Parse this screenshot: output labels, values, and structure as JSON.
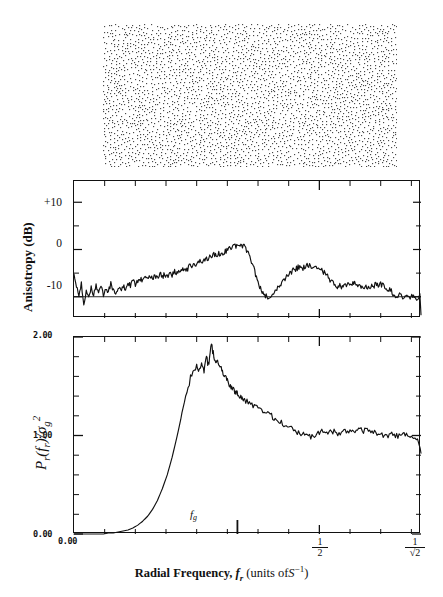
{
  "figure": {
    "panels": {
      "dot_pattern": {
        "name": "stochastic dot pattern"
      },
      "anisotropy": {
        "ylabel_text": "Anisotropy  (dB)",
        "yticks": [
          {
            "value": 10,
            "label": "+10"
          },
          {
            "value": 0,
            "label": "0"
          },
          {
            "value": -10,
            "label": "-10"
          }
        ],
        "reference_line": -10
      },
      "power": {
        "ylabel_parts": {
          "p": "P",
          "rsub": "r",
          "open": "(",
          "f": "f",
          "fsub": "r",
          "close": ")",
          "slash": "/",
          "sigma": "σ",
          "gsub": "g",
          "exp": "2"
        },
        "yticks": [
          {
            "value": 2.0,
            "label": "2.00"
          },
          {
            "value": 1.0,
            "label": "1.00"
          },
          {
            "value": 0.0,
            "label": "0.00"
          }
        ]
      }
    },
    "xaxis": {
      "caption_prefix": "Radial Frequency,",
      "caption_var": "f",
      "caption_var_sub": "r",
      "caption_units_open": "(units of",
      "caption_units_var": "S",
      "caption_units_exp": "−1",
      "caption_units_close": ")",
      "ticks": [
        {
          "value": 0.0,
          "label": "0.00",
          "kind": "dotnum"
        },
        {
          "value": 0.5,
          "label": "1/2",
          "num": "1",
          "den": "2",
          "kind": "fraction"
        },
        {
          "value": 0.7071,
          "label": "1/√2",
          "num": "1",
          "den": "√2",
          "kind": "fraction"
        }
      ],
      "annotation": {
        "name": "f_g",
        "var": "f",
        "sub": "g",
        "value": 0.333
      }
    }
  },
  "chart_data": [
    {
      "type": "line",
      "title": "Anisotropy spectrum",
      "xlabel": "Radial Frequency, f_r (units of S^-1)",
      "ylabel": "Anisotropy (dB)",
      "xlim": [
        0.0,
        0.7071
      ],
      "ylim": [
        -14.5,
        14.5
      ],
      "yticks": [
        10,
        0,
        -10
      ],
      "grid": false,
      "legend": "none",
      "reference_line_y": -10,
      "x": [
        0.0,
        0.005,
        0.01,
        0.015,
        0.02,
        0.025,
        0.03,
        0.035,
        0.04,
        0.045,
        0.05,
        0.055,
        0.06,
        0.065,
        0.07,
        0.075,
        0.08,
        0.085,
        0.09,
        0.095,
        0.1,
        0.105,
        0.11,
        0.115,
        0.12,
        0.125,
        0.13,
        0.135,
        0.14,
        0.145,
        0.15,
        0.155,
        0.16,
        0.165,
        0.17,
        0.175,
        0.18,
        0.185,
        0.19,
        0.195,
        0.2,
        0.205,
        0.21,
        0.215,
        0.22,
        0.225,
        0.23,
        0.235,
        0.24,
        0.245,
        0.25,
        0.255,
        0.26,
        0.265,
        0.27,
        0.275,
        0.28,
        0.285,
        0.29,
        0.295,
        0.3,
        0.305,
        0.31,
        0.315,
        0.32,
        0.325,
        0.33,
        0.335,
        0.34,
        0.345,
        0.35,
        0.355,
        0.36,
        0.365,
        0.37,
        0.375,
        0.38,
        0.385,
        0.39,
        0.395,
        0.4,
        0.405,
        0.41,
        0.415,
        0.42,
        0.425,
        0.43,
        0.435,
        0.44,
        0.445,
        0.45,
        0.455,
        0.46,
        0.465,
        0.47,
        0.475,
        0.48,
        0.485,
        0.49,
        0.495,
        0.5,
        0.505,
        0.51,
        0.515,
        0.52,
        0.525,
        0.53,
        0.535,
        0.54,
        0.545,
        0.55,
        0.555,
        0.56,
        0.565,
        0.57,
        0.575,
        0.58,
        0.585,
        0.59,
        0.595,
        0.6,
        0.605,
        0.61,
        0.615,
        0.62,
        0.625,
        0.63,
        0.635,
        0.64,
        0.645,
        0.65,
        0.655,
        0.66,
        0.665,
        0.67,
        0.675,
        0.68,
        0.685,
        0.69,
        0.695,
        0.7,
        0.7071
      ],
      "values": [
        -5.1,
        -7.6,
        -9.4,
        -7.3,
        -11.8,
        -8.6,
        -10.2,
        -8.2,
        -9.6,
        -7.5,
        -8.9,
        -7.7,
        -9.6,
        -8.0,
        -9.1,
        -7.2,
        -8.4,
        -9.1,
        -7.9,
        -8.7,
        -7.6,
        -8.4,
        -7.0,
        -7.8,
        -6.6,
        -7.4,
        -6.9,
        -6.2,
        -6.9,
        -6.0,
        -6.6,
        -5.7,
        -6.3,
        -5.5,
        -6.2,
        -4.9,
        -5.8,
        -5.2,
        -5.9,
        -4.8,
        -5.4,
        -4.5,
        -5.1,
        -4.4,
        -4.6,
        -3.9,
        -4.4,
        -3.5,
        -3.9,
        -2.8,
        -3.3,
        -2.4,
        -2.7,
        -2.0,
        -2.1,
        -1.6,
        -1.8,
        -1.2,
        -1.4,
        -0.9,
        -1.0,
        -0.6,
        -0.3,
        0.0,
        0.3,
        0.6,
        0.8,
        1.0,
        0.9,
        0.7,
        0.2,
        -0.7,
        -2.0,
        -3.6,
        -5.3,
        -6.9,
        -8.2,
        -9.1,
        -9.7,
        -10.0,
        -9.9,
        -9.5,
        -8.9,
        -8.2,
        -7.4,
        -6.7,
        -6.1,
        -5.6,
        -5.2,
        -4.6,
        -4.2,
        -3.9,
        -3.6,
        -4.1,
        -3.6,
        -3.4,
        -3.3,
        -3.6,
        -3.4,
        -3.7,
        -4.0,
        -4.4,
        -4.9,
        -5.5,
        -6.2,
        -6.8,
        -7.3,
        -7.8,
        -7.6,
        -7.9,
        -7.6,
        -7.3,
        -7.0,
        -7.2,
        -7.1,
        -7.5,
        -7.8,
        -8.0,
        -8.3,
        -8.1,
        -8.3,
        -8.0,
        -7.7,
        -7.5,
        -7.7,
        -7.4,
        -7.7,
        -8.1,
        -8.4,
        -8.7,
        -9.3,
        -9.6,
        -9.8,
        -9.7,
        -9.9,
        -10.3,
        -9.6,
        -10.2,
        -9.8,
        -10.4,
        -10.1,
        -9.4,
        -11.2,
        -13.8
      ]
    },
    {
      "type": "line",
      "title": "Radial power spectrum",
      "xlabel": "Radial Frequency, f_r (units of S^-1)",
      "ylabel": "P_r(f_r)/sigma_g^2",
      "xlim": [
        0.0,
        0.7071
      ],
      "ylim": [
        0.0,
        2.0
      ],
      "yticks": [
        0.0,
        1.0,
        2.0
      ],
      "grid": false,
      "legend": "none",
      "x": [
        0.0,
        0.01,
        0.02,
        0.03,
        0.04,
        0.05,
        0.06,
        0.07,
        0.08,
        0.09,
        0.1,
        0.11,
        0.12,
        0.13,
        0.14,
        0.15,
        0.16,
        0.17,
        0.18,
        0.19,
        0.2,
        0.21,
        0.22,
        0.23,
        0.24,
        0.25,
        0.255,
        0.26,
        0.265,
        0.27,
        0.275,
        0.28,
        0.285,
        0.29,
        0.295,
        0.3,
        0.305,
        0.31,
        0.315,
        0.32,
        0.325,
        0.33,
        0.335,
        0.34,
        0.345,
        0.35,
        0.36,
        0.37,
        0.38,
        0.39,
        0.4,
        0.41,
        0.42,
        0.43,
        0.44,
        0.45,
        0.46,
        0.47,
        0.48,
        0.49,
        0.5,
        0.51,
        0.52,
        0.53,
        0.54,
        0.55,
        0.56,
        0.57,
        0.58,
        0.59,
        0.6,
        0.61,
        0.62,
        0.63,
        0.64,
        0.65,
        0.66,
        0.67,
        0.68,
        0.69,
        0.7,
        0.7071
      ],
      "values": [
        0.0,
        0.0,
        0.0,
        0.0,
        0.0,
        0.0,
        0.0,
        0.01,
        0.01,
        0.02,
        0.03,
        0.04,
        0.06,
        0.09,
        0.13,
        0.18,
        0.25,
        0.34,
        0.46,
        0.6,
        0.78,
        0.99,
        1.22,
        1.45,
        1.63,
        1.7,
        1.64,
        1.72,
        1.66,
        1.78,
        1.71,
        1.93,
        1.8,
        1.74,
        1.72,
        1.68,
        1.62,
        1.58,
        1.53,
        1.49,
        1.46,
        1.44,
        1.42,
        1.39,
        1.37,
        1.35,
        1.31,
        1.29,
        1.25,
        1.22,
        1.21,
        1.17,
        1.14,
        1.11,
        1.08,
        1.05,
        1.02,
        1.0,
        0.99,
        1.0,
        1.03,
        1.05,
        1.03,
        1.05,
        1.02,
        1.04,
        1.03,
        1.05,
        1.07,
        1.05,
        1.06,
        1.04,
        1.02,
        1.0,
        0.99,
        1.01,
        0.99,
        1.0,
        1.02,
        0.98,
        0.95,
        0.82
      ]
    }
  ]
}
